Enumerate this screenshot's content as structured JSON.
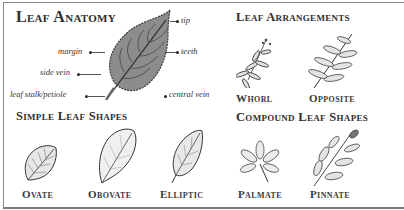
{
  "sections": {
    "anatomy": {
      "title": "Leaf Anatomy",
      "labels": {
        "tip": "tip",
        "margin": "margin",
        "teeth": "teeth",
        "side_vein": "side vein",
        "central_vein": "central vein",
        "petiole": "leaf stalk/petiole"
      }
    },
    "simple_shapes": {
      "title": "Simple Leaf Shapes",
      "items": [
        "Ovate",
        "Obovate",
        "Elliptic"
      ]
    },
    "arrangements": {
      "title": "Leaf Arrangements",
      "items": [
        "Whorl",
        "Opposite"
      ]
    },
    "compound_shapes": {
      "title": "Compound Leaf Shapes",
      "items": [
        "Palmate",
        "Pinnate"
      ]
    }
  },
  "colors": {
    "ink": "#2e2e2e",
    "leaf_fill": "#8c8c8c",
    "border": "#8a8a8a"
  }
}
